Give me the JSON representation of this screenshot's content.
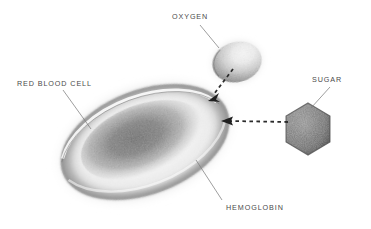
{
  "figure": {
    "background_color": "#ffffff",
    "ink_color": "#4a4a4a",
    "style": "graphite pencil scientific illustration"
  },
  "labels": {
    "oxygen": "OXYGEN",
    "red_blood_cell": "RED BLOOD CELL",
    "sugar": "SUGAR",
    "hemoglobin": "HEMOGLOBIN"
  },
  "objects": [
    {
      "name": "red-blood-cell",
      "shape": "biconcave-disc-ellipse",
      "center": [
        145,
        142
      ],
      "rx": 88,
      "ry": 52,
      "rotation_deg": -21,
      "fill": "graphite-gradient",
      "label": "RED BLOOD CELL"
    },
    {
      "name": "oxygen-molecule",
      "shape": "sphere",
      "center": [
        237,
        62
      ],
      "rx": 25,
      "ry": 20,
      "rotation_deg": -15,
      "fill": "graphite-sphere",
      "label": "OXYGEN"
    },
    {
      "name": "sugar-molecule",
      "shape": "hexagon",
      "center": [
        308,
        129
      ],
      "radius": 26,
      "rotation_deg": 0,
      "fill": "dark-graphite",
      "label": "SUGAR"
    }
  ],
  "arrows": [
    {
      "name": "oxygen-to-cell-arrow",
      "style": "dashed",
      "from": [
        233,
        69
      ],
      "to": [
        210,
        100
      ],
      "head": "filled-triangle",
      "meaning": "oxygen binds to hemoglobin"
    },
    {
      "name": "sugar-to-cell-arrow",
      "style": "dashed",
      "from": [
        288,
        122
      ],
      "to": [
        222,
        121
      ],
      "head": "filled-triangle",
      "meaning": "sugar binds to hemoglobin"
    }
  ],
  "leader_lines": [
    {
      "name": "oxygen-leader",
      "from": [
        200,
        25
      ],
      "to": [
        219,
        48
      ]
    },
    {
      "name": "red-blood-cell-leader",
      "from": [
        63,
        90
      ],
      "to": [
        91,
        129
      ]
    },
    {
      "name": "sugar-leader",
      "from": [
        330,
        87
      ],
      "to": [
        311,
        108
      ]
    },
    {
      "name": "hemoglobin-leader",
      "from": [
        196,
        160
      ],
      "to": [
        222,
        200
      ]
    }
  ],
  "label_positions": {
    "oxygen": {
      "x": 172,
      "y": 12
    },
    "red_blood_cell": {
      "x": 17,
      "y": 79
    },
    "sugar": {
      "x": 312,
      "y": 75
    },
    "hemoglobin": {
      "x": 226,
      "y": 203
    }
  }
}
